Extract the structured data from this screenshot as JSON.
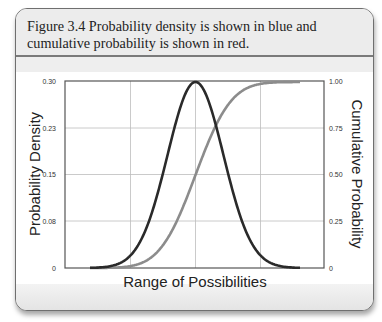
{
  "figure": {
    "caption_line1": "Figure 3.4  Probability density is shown in blue and",
    "caption_line2": "cumulative probability is shown in red."
  },
  "chart_data": {
    "type": "line",
    "title": "Figure 3.4 Probability density is shown in blue and cumulative probability is shown in red.",
    "xlabel": "Range of Possibilities",
    "ylabel": "Probability Density",
    "ylabel_right": "Cumulative Probability",
    "left_axis": {
      "ylim": [
        0,
        0.3
      ],
      "ticks": [
        "0.30",
        "0.23",
        "0.15",
        "0.08",
        "0"
      ]
    },
    "right_axis": {
      "ylim": [
        0,
        1.0
      ],
      "ticks": [
        "1.00",
        "0.75",
        "0.50",
        "0.25",
        "0"
      ]
    },
    "grid": true,
    "x_gridlines": 3,
    "series": [
      {
        "name": "Probability Density",
        "color": "#2b2b2b",
        "axis": "left",
        "shape": "normal pdf",
        "x": [
          -3,
          -2,
          -1.5,
          -1,
          -0.5,
          0,
          0.5,
          1,
          1.5,
          2,
          3
        ],
        "values": [
          0.001,
          0.016,
          0.039,
          0.073,
          0.106,
          0.3,
          0.106,
          0.073,
          0.039,
          0.016,
          0.001
        ]
      },
      {
        "name": "Cumulative Probability",
        "color": "#8a8a8a",
        "axis": "right",
        "shape": "normal cdf",
        "x": [
          -3,
          -2,
          -1,
          0,
          1,
          2,
          3
        ],
        "values": [
          0.0,
          0.02,
          0.16,
          0.5,
          0.84,
          0.98,
          1.0
        ]
      }
    ]
  }
}
